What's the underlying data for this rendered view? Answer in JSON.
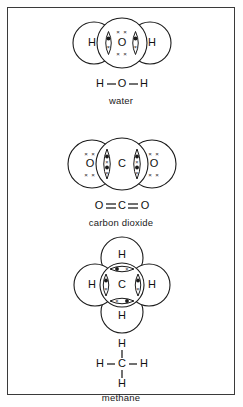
{
  "page": {
    "background_color": "#ffffff",
    "border_color": "#3a3a3a",
    "ink_color": "#1b1b1b"
  },
  "molecules": [
    {
      "id": "water",
      "name": "water",
      "structural_formula": "H—O—H",
      "central_atom": "O",
      "outer_atoms": [
        "H",
        "H"
      ],
      "bond_type": "single",
      "lone_pairs_top": "× ×",
      "lone_pairs_bottom": "× ×",
      "shared_pairs_per_bond": 1
    },
    {
      "id": "carbon-dioxide",
      "name": "carbon dioxide",
      "structural_formula": "O=C=O",
      "central_atom": "C",
      "outer_atoms": [
        "O",
        "O"
      ],
      "bond_type": "double",
      "lone_pairs_top": "× ×",
      "lone_pairs_bottom": "× ×",
      "shared_pairs_per_bond": 2
    },
    {
      "id": "methane",
      "name": "methane",
      "structural_formula": "H—C—H",
      "central_atom": "C",
      "outer_atoms": [
        "H",
        "H",
        "H",
        "H"
      ],
      "bond_type": "single",
      "shared_pairs_per_bond": 1,
      "top_atom": "H",
      "bottom_atom": "H",
      "left_atom": "H",
      "right_atom": "H"
    }
  ],
  "water_labels": {
    "caption": "water",
    "atom_left": "H",
    "atom_center": "O",
    "atom_right": "H",
    "f_left": "H",
    "f_center": "O",
    "f_right": "H"
  },
  "co2_labels": {
    "caption": "carbon dioxide",
    "atom_left": "O",
    "atom_center": "C",
    "atom_right": "O",
    "f_left": "O",
    "f_center": "C",
    "f_right": "O"
  },
  "methane_labels": {
    "caption": "methane",
    "atom_top": "H",
    "atom_center": "C",
    "atom_left": "H",
    "atom_right": "H",
    "atom_bottom": "H",
    "f_top": "H",
    "f_left": "H",
    "f_center": "C",
    "f_right": "H",
    "f_bottom": "H"
  }
}
